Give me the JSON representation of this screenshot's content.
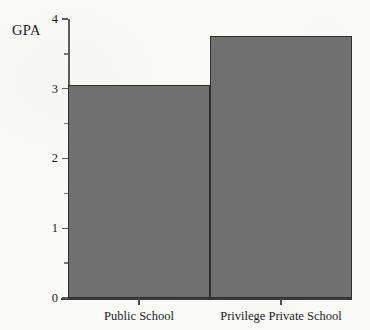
{
  "chart_data": {
    "type": "bar",
    "title": "",
    "xlabel": "",
    "ylabel": "GPA",
    "ylim": [
      0,
      4
    ],
    "grid": false,
    "legend": null,
    "categories": [
      "Public School",
      "Privilege Private School"
    ],
    "values": [
      3.05,
      3.75
    ],
    "ytick_labels": [
      "0",
      "1",
      "2",
      "3",
      "4"
    ],
    "ytick_values": [
      0,
      1,
      2,
      3,
      4
    ],
    "yminor_tick_values": [
      0.5,
      1.5,
      2.5,
      3.5
    ],
    "bar_color": "#707070",
    "bar_border_color": "#2e2e2e",
    "axis_color": "#4a4a4a",
    "background_color": "#fbfbf9",
    "text_color": "#1b1b1b"
  },
  "axis": {
    "y_title": "GPA"
  }
}
